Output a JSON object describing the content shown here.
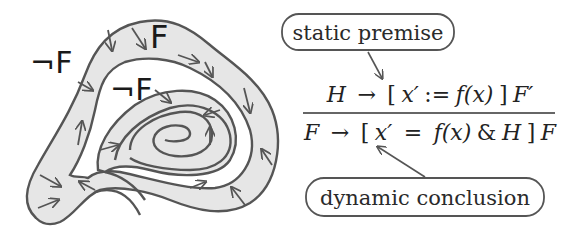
{
  "diagram": {
    "labels": {
      "not_f_outer": "¬F",
      "f_top": "F",
      "not_f_inner": "¬F"
    },
    "callouts": {
      "premise": "static premise",
      "conclusion": "dynamic conclusion"
    },
    "rule": {
      "premise": {
        "lhs": "H",
        "arrow": "→",
        "bracket_open": "[",
        "var": "x′",
        "assign": ":=",
        "rhs_fn": "f(x)",
        "bracket_close": "]",
        "post": "F′"
      },
      "conclusion": {
        "lhs": "F",
        "arrow": "→",
        "bracket_open": "[",
        "var": "x′",
        "eq": "=",
        "rhs_fn": "f(x)",
        "amp": "&",
        "domain": "H",
        "bracket_close": "]",
        "post": "F"
      }
    },
    "colors": {
      "band_fill": "#e6e6e6",
      "stroke": "#555555",
      "text": "#1a1a1a"
    }
  }
}
